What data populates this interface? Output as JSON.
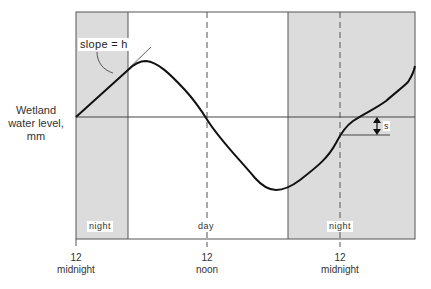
{
  "diagram": {
    "y_axis_label": [
      "Wetland",
      "water level,",
      "mm"
    ],
    "annotations": {
      "slope_label": "slope = h",
      "s_label": "s"
    },
    "periods": [
      {
        "label": "night",
        "x_start": 76,
        "x_end": 128
      },
      {
        "label": "day",
        "x_start": 128,
        "x_end": 288
      },
      {
        "label": "night",
        "x_start": 288,
        "x_end": 415
      }
    ],
    "x_ticks": [
      {
        "line1": "12",
        "line2": "midnight",
        "x": 76
      },
      {
        "line1": "12",
        "line2": "noon",
        "x": 207
      },
      {
        "line1": "12",
        "line2": "midnight",
        "x": 340
      }
    ],
    "colors": {
      "night_shade": "#dcdcdc",
      "curve": "#111111",
      "frame": "#555555"
    }
  }
}
